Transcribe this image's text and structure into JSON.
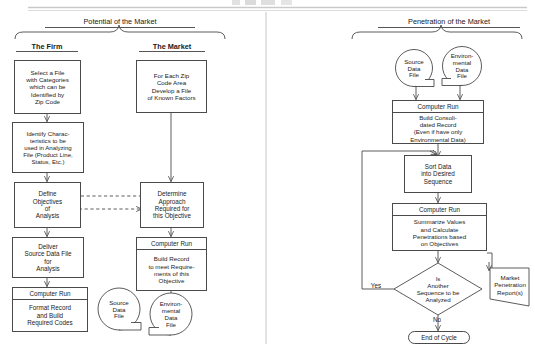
{
  "page": {
    "width": 535,
    "height": 346,
    "background": "#ffffff",
    "line_color": "#4a4a4a"
  },
  "left_panel": {
    "title": "Potential of the Market",
    "columns": [
      {
        "label": "The Firm"
      },
      {
        "label": "The Market"
      }
    ],
    "firm_nodes": [
      {
        "name": "select-file-box",
        "type": "process",
        "text": "Select a File\nwith Categories\nwhich can be\nIdentified by\nZip Code"
      },
      {
        "name": "identify-characteristics-box",
        "type": "process",
        "text": "Identify Charac-\nteristics to be\nused in Analyzing\nFile (Product Line,\nStatus, Etc.)"
      },
      {
        "name": "define-objectives-box",
        "type": "process",
        "text": "Define\nObjectives\nof\nAnalysis"
      },
      {
        "name": "deliver-source-data-box",
        "type": "process",
        "text": "Deliver\nSource Data File\nfor\nAnalysis"
      },
      {
        "name": "format-record-box",
        "type": "computer-run",
        "header": "Computer Run",
        "text": "Format Record\nand Build\nRequired Codes"
      }
    ],
    "market_nodes": [
      {
        "name": "zip-code-file-box",
        "type": "process",
        "text": "For Each Zip\nCode Area\nDevelop a File\nof Known Factors"
      },
      {
        "name": "determine-approach-box",
        "type": "process",
        "text": "Determine\nApproach\nRequired for\nthis Objective"
      },
      {
        "name": "build-record-box",
        "type": "computer-run",
        "header": "Computer Run",
        "text": "Build Record\nto meet Require-\nments of this\nObjective"
      }
    ],
    "stores": [
      {
        "name": "source-data-file-store-left",
        "text": "Source\nData\nFile"
      },
      {
        "name": "environmental-data-file-store-left",
        "text": "Environ-\nmental\nData\nFile"
      }
    ]
  },
  "right_panel": {
    "title": "Penetration of the Market",
    "stores": [
      {
        "name": "source-data-file-store-right",
        "text": "Source\nData\nFile"
      },
      {
        "name": "environmental-data-file-store-right",
        "text": "Environ-\nmental\nData\nFile"
      }
    ],
    "nodes": [
      {
        "name": "build-consolidated-record-box",
        "type": "computer-run",
        "header": "Computer Run",
        "text": "Build Consoli-\ndated Record\n(Even if have only\nEnvironmental Data)"
      },
      {
        "name": "sort-data-box",
        "type": "process",
        "text": "Sort Data\ninto Desired\nSequence"
      },
      {
        "name": "summarize-values-box",
        "type": "computer-run",
        "header": "Computer Run",
        "text": "Summarize Values\nand Calculate\nPenetrations based\non Objectives"
      }
    ],
    "decision": {
      "name": "another-sequence-decision",
      "text": "Is\nAnother\nSequence to be\nAnalyzed",
      "yes_label": "Yes",
      "no_label": "No"
    },
    "report": {
      "name": "market-penetration-report-doc",
      "text": "Market\nPenetration\nReport(s)"
    },
    "terminator": {
      "name": "end-of-cycle-terminator",
      "text": "End of Cycle"
    }
  }
}
